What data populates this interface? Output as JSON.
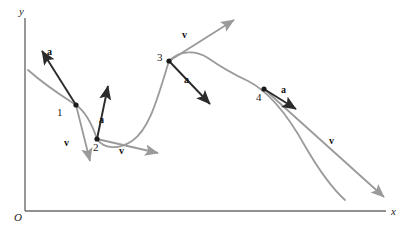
{
  "figure": {
    "colors": {
      "axis": "#6b6b6b",
      "curve": "#9a9a9a",
      "velocity": "#9a9a9a",
      "acceleration": "#2b2b2b",
      "point": "#1a1a1a",
      "text": "#1a1a1a",
      "background": "#ffffff"
    }
  },
  "axes": {
    "origin_label": "O",
    "x_label": "x",
    "y_label": "y",
    "x_axis": {
      "x1": 25,
      "y1": 211,
      "x2": 386,
      "y2": 211
    },
    "y_axis": {
      "x1": 25,
      "y1": 211,
      "x2": 25,
      "y2": 18
    }
  },
  "curve": {
    "name": "trajectory-path",
    "path": "M 28 70 C 46 86, 62 96, 76 105 C 86 112, 92 124, 97 139 C 104 149, 118 150, 132 141 C 150 129, 158 96, 169 61 C 180 50, 196 50, 208 58 C 218 65, 233 74, 248 81 C 266 90, 286 112, 305 146 C 320 172, 334 190, 345 200"
  },
  "points": [
    {
      "id": "1",
      "label": "1",
      "x": 76,
      "y": 105,
      "label_x": 57,
      "label_y": 107
    },
    {
      "id": "2",
      "label": "2",
      "x": 97,
      "y": 139,
      "label_x": 93,
      "label_y": 142
    },
    {
      "id": "3",
      "label": "3",
      "x": 169,
      "y": 61,
      "label_x": 157,
      "label_y": 52
    },
    {
      "id": "4",
      "label": "4",
      "x": 264,
      "y": 89,
      "label_x": 256,
      "label_y": 92
    }
  ],
  "vectors": {
    "acceleration": [
      {
        "point": "1",
        "label": "a",
        "x1": 76,
        "y1": 105,
        "x2": 42,
        "y2": 51,
        "label_x": 47,
        "label_y": 47
      },
      {
        "point": "2",
        "label": "a",
        "x1": 97,
        "y1": 139,
        "x2": 108,
        "y2": 86,
        "label_x": 99,
        "label_y": 115
      },
      {
        "point": "3",
        "label": "a",
        "x1": 169,
        "y1": 61,
        "x2": 210,
        "y2": 104,
        "label_x": 184,
        "label_y": 75
      },
      {
        "point": "4",
        "label": "a",
        "x1": 264,
        "y1": 89,
        "x2": 296,
        "y2": 109,
        "label_x": 281,
        "label_y": 85
      }
    ],
    "velocity": [
      {
        "point": "1",
        "label": "v",
        "x1": 76,
        "y1": 105,
        "x2": 90,
        "y2": 161,
        "label_x": 64,
        "label_y": 138
      },
      {
        "point": "2",
        "label": "v",
        "x1": 97,
        "y1": 139,
        "x2": 158,
        "y2": 153,
        "label_x": 119,
        "label_y": 146
      },
      {
        "point": "3",
        "label": "v",
        "x1": 169,
        "y1": 61,
        "x2": 234,
        "y2": 20,
        "label_x": 182,
        "label_y": 30
      },
      {
        "point": "4",
        "label": "v",
        "x1": 264,
        "y1": 89,
        "x2": 384,
        "y2": 197,
        "label_x": 329,
        "label_y": 136
      }
    ]
  }
}
